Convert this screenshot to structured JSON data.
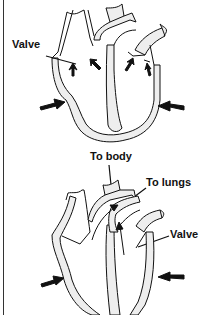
{
  "figure": {
    "panels": [
      {
        "id": "top",
        "phase": "ventricles-relaxed",
        "labels": [
          {
            "text": "Valve",
            "target": "atrioventricular-valve-right"
          }
        ],
        "arrows": [
          "compression-left",
          "compression-right",
          "valve-arrow-1",
          "valve-arrow-2",
          "valve-arrow-3",
          "valve-arrow-4"
        ]
      },
      {
        "id": "bottom",
        "phase": "ventricles-contracting",
        "labels": [
          {
            "text": "To body",
            "target": "aorta"
          },
          {
            "text": "To lungs",
            "target": "pulmonary-artery"
          },
          {
            "text": "Valve",
            "target": "atrioventricular-valve-left"
          }
        ],
        "arrows": [
          "compression-left",
          "compression-right",
          "flow-arrow-aorta",
          "flow-arrow-pulmonary"
        ]
      }
    ]
  },
  "labels": {
    "top_valve": "Valve",
    "to_body": "To body",
    "to_lungs": "To lungs",
    "bottom_valve": "Valve"
  },
  "colors": {
    "ink": "#111111",
    "wall_fill": "#eeeeee",
    "background": "#ffffff"
  }
}
